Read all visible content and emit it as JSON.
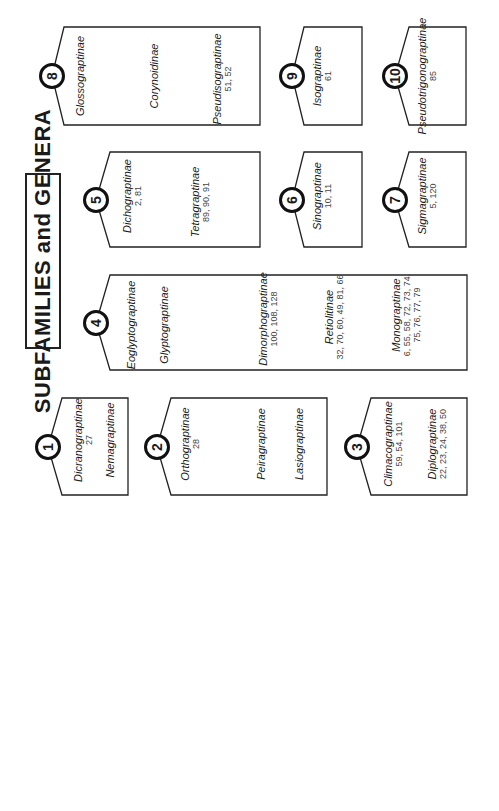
{
  "title": "SUBFAMILIES and GENERA",
  "groups": [
    {
      "number": "1",
      "subfamilies": [
        {
          "name": "Dicranograptinae",
          "genera": "27"
        },
        {
          "name": "Nemagraptinae",
          "genera": ""
        }
      ]
    },
    {
      "number": "2",
      "subfamilies": [
        {
          "name": "Orthograptinae",
          "genera": "28"
        },
        {
          "name": "Peiragraptinae",
          "genera": ""
        },
        {
          "name": "Lasiograptinae",
          "genera": ""
        }
      ]
    },
    {
      "number": "3",
      "subfamilies": [
        {
          "name": "Climacograptinae",
          "genera": "59, 54, 101"
        },
        {
          "name": "Diplograptinae",
          "genera": "22, 23, 24, 38, 50"
        }
      ]
    },
    {
      "number": "4",
      "subfamilies": [
        {
          "name": "Eoglyptograptinae",
          "genera": ""
        },
        {
          "name": "Glyptograptinae",
          "genera": ""
        },
        {
          "name": "Dimorphograptinae",
          "genera": "100, 108, 128"
        },
        {
          "name": "Retiolitinae",
          "genera": "32, 70, 60, 49, 81, 66"
        },
        {
          "name": "Monograptinae",
          "genera": "6, 55, 58, 72, 73, 74,",
          "genera2": "75, 76, 77, 79"
        }
      ]
    },
    {
      "number": "5",
      "subfamilies": [
        {
          "name": "Dichograptinae",
          "genera": "2, 81"
        },
        {
          "name": "Tetragraptinae",
          "genera": "89, 90, 91"
        }
      ]
    },
    {
      "number": "6",
      "subfamilies": [
        {
          "name": "Sinograptinae",
          "genera": "10, 11"
        }
      ]
    },
    {
      "number": "7",
      "subfamilies": [
        {
          "name": "Sigmagraptinae",
          "genera": "5, 120"
        }
      ]
    },
    {
      "number": "8",
      "subfamilies": [
        {
          "name": "Glossograptinae",
          "genera": ""
        },
        {
          "name": "Corynoidinae",
          "genera": ""
        },
        {
          "name": "Pseudisograptinae",
          "genera": "51, 52"
        }
      ]
    },
    {
      "number": "9",
      "subfamilies": [
        {
          "name": "Isograptinae",
          "genera": "61"
        }
      ]
    },
    {
      "number": "10",
      "subfamilies": [
        {
          "name": "Pseudotrigonograptinae",
          "genera": "85"
        }
      ]
    }
  ]
}
